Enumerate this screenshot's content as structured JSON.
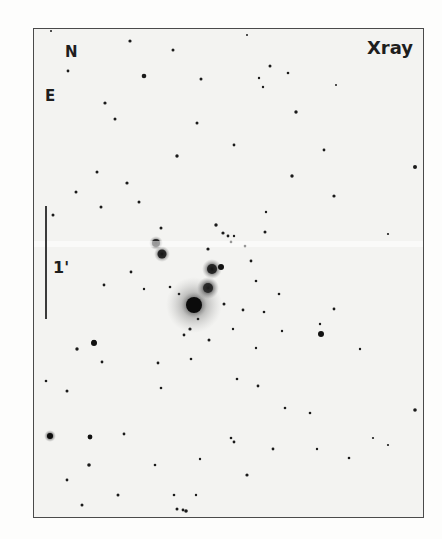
{
  "panel": {
    "title": "Xray",
    "orientation": {
      "north_label": "N",
      "east_label": "E"
    },
    "scale_bar": {
      "label": "1'"
    },
    "colors": {
      "background": "#f3f3f1",
      "stars": "#141414",
      "frame": "#4a4a4a"
    }
  }
}
